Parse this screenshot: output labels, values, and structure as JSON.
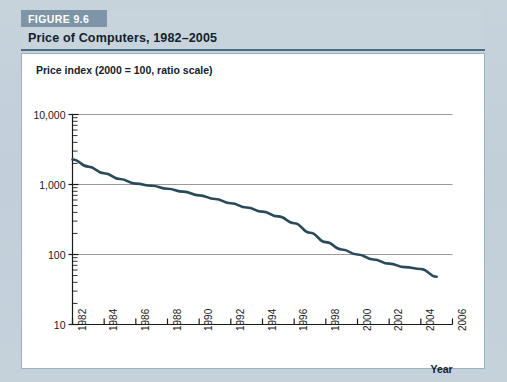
{
  "figure": {
    "badge": "FIGURE 9.6",
    "title": "Price of Computers, 1982–2005"
  },
  "colors": {
    "badge_bg": "#7d95a6",
    "band_bg": "#c8d4dc",
    "rule": "#4b6c82",
    "page_bg": "#c3d0d9",
    "line": "#2a4a5a",
    "grid": "#9a9a9a",
    "axis": "#1a1a1a"
  },
  "chart_data": {
    "type": "line",
    "title": "Price of Computers, 1982–2005",
    "ylabel": "Price index (2000 = 100, ratio scale)",
    "xlabel": "Year",
    "yscale": "log",
    "ylim": [
      10,
      10000
    ],
    "xlim": [
      1982,
      2006
    ],
    "grid": true,
    "legend": "none",
    "ytick_labels": [
      "10,000",
      "1,000",
      "100",
      "10"
    ],
    "ytick_values": [
      10000,
      1000,
      100,
      10
    ],
    "xtick_labels": [
      "1982",
      "1984",
      "1986",
      "1988",
      "1990",
      "1992",
      "1994",
      "1996",
      "1998",
      "2000",
      "2002",
      "2004",
      "2006"
    ],
    "xtick_values": [
      1982,
      1984,
      1986,
      1988,
      1990,
      1992,
      1994,
      1996,
      1998,
      2000,
      2002,
      2004,
      2006
    ],
    "series": [
      {
        "name": "Price index of computers",
        "x": [
          1982,
          1983,
          1984,
          1985,
          1986,
          1987,
          1988,
          1989,
          1990,
          1991,
          1992,
          1993,
          1994,
          1995,
          1996,
          1997,
          1998,
          1999,
          2000,
          2001,
          2002,
          2003,
          2004,
          2005
        ],
        "values": [
          2280,
          1800,
          1450,
          1200,
          1030,
          960,
          870,
          790,
          700,
          620,
          540,
          470,
          410,
          350,
          280,
          205,
          150,
          118,
          100,
          85,
          74,
          66,
          62,
          48
        ]
      }
    ]
  }
}
